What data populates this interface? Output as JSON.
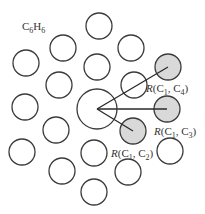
{
  "title": {
    "main": "C",
    "sub1": "6",
    "mid": "H",
    "sub2": "6"
  },
  "colors": {
    "highlight": "#d9d9d9",
    "stroke": "#3a3a3a",
    "background": "#ffffff"
  },
  "center_atom": {
    "x": 97,
    "y": 109,
    "r": 20
  },
  "atoms": [
    {
      "x": 99,
      "y": 26
    },
    {
      "x": 63,
      "y": 48
    },
    {
      "x": 131,
      "y": 48
    },
    {
      "x": 26,
      "y": 63
    },
    {
      "x": 97,
      "y": 67
    },
    {
      "x": 59,
      "y": 85
    },
    {
      "x": 134,
      "y": 85
    },
    {
      "x": 25,
      "y": 107
    },
    {
      "x": 56,
      "y": 130
    },
    {
      "x": 22,
      "y": 152
    },
    {
      "x": 94,
      "y": 153
    },
    {
      "x": 170,
      "y": 151
    },
    {
      "x": 62,
      "y": 171
    },
    {
      "x": 128,
      "y": 172
    },
    {
      "x": 94,
      "y": 192
    }
  ],
  "highlighted": [
    {
      "id": "C4",
      "x": 168,
      "y": 67
    },
    {
      "id": "C3",
      "x": 167,
      "y": 109
    },
    {
      "id": "C2",
      "x": 133,
      "y": 131
    }
  ],
  "labels": [
    {
      "id": "r14",
      "R": "R",
      "open": "(C",
      "s1": "1",
      "mid": ", C",
      "s2": "4",
      "close": ")",
      "x": 146,
      "y": 92
    },
    {
      "id": "r13",
      "R": "R",
      "open": "(C",
      "s1": "1",
      "mid": ", C",
      "s2": "3",
      "close": ")",
      "x": 154,
      "y": 135
    },
    {
      "id": "r12",
      "R": "R",
      "open": "(C",
      "s1": "1",
      "mid": ", C",
      "s2": "2",
      "close": ")",
      "x": 111,
      "y": 157
    }
  ]
}
